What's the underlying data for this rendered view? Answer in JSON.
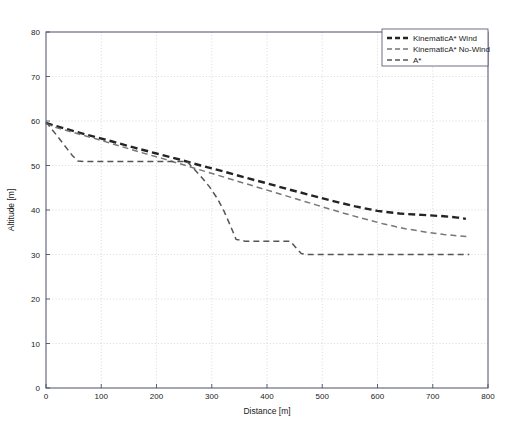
{
  "chart_data": {
    "type": "line",
    "title": "",
    "xlabel": "Distance [m]",
    "ylabel": "Altitude [m]",
    "xlim": [
      0,
      800
    ],
    "ylim": [
      0,
      80
    ],
    "xticks": [
      0,
      100,
      200,
      300,
      400,
      500,
      600,
      700,
      800
    ],
    "yticks": [
      0,
      10,
      20,
      30,
      40,
      50,
      60,
      70,
      80
    ],
    "xtick_labels": [
      "0",
      "100",
      "200",
      "300",
      "400",
      "500",
      "600",
      "700",
      "800"
    ],
    "ytick_labels": [
      "0",
      "10",
      "20",
      "30",
      "40",
      "50",
      "60",
      "70",
      "80"
    ],
    "grid": true,
    "grid_style": "dotted",
    "legend_position": "top-right",
    "series": [
      {
        "name": "KinematicA* Wind",
        "color": "#242424",
        "width": 2.4,
        "dash": "7 4",
        "points": [
          [
            0,
            59.6
          ],
          [
            14,
            59.0
          ],
          [
            40,
            58.1
          ],
          [
            80,
            56.7
          ],
          [
            120,
            55.4
          ],
          [
            160,
            54.0
          ],
          [
            200,
            52.7
          ],
          [
            240,
            51.4
          ],
          [
            280,
            50.0
          ],
          [
            320,
            48.7
          ],
          [
            360,
            47.3
          ],
          [
            400,
            46.0
          ],
          [
            440,
            44.6
          ],
          [
            480,
            43.3
          ],
          [
            520,
            42.0
          ],
          [
            560,
            40.8
          ],
          [
            600,
            39.8
          ],
          [
            640,
            39.2
          ],
          [
            680,
            38.9
          ],
          [
            720,
            38.6
          ],
          [
            745,
            38.3
          ],
          [
            760,
            38.0
          ]
        ]
      },
      {
        "name": "KinematicA* No-Wind",
        "color": "#777777",
        "width": 1.5,
        "dash": "6 4",
        "points": [
          [
            0,
            59.4
          ],
          [
            16,
            58.6
          ],
          [
            50,
            57.4
          ],
          [
            90,
            56.0
          ],
          [
            130,
            54.5
          ],
          [
            170,
            53.0
          ],
          [
            210,
            51.6
          ],
          [
            250,
            50.1
          ],
          [
            290,
            48.6
          ],
          [
            330,
            47.1
          ],
          [
            370,
            45.6
          ],
          [
            410,
            44.1
          ],
          [
            450,
            42.6
          ],
          [
            490,
            41.1
          ],
          [
            530,
            39.6
          ],
          [
            570,
            38.2
          ],
          [
            610,
            36.9
          ],
          [
            650,
            35.8
          ],
          [
            690,
            35.0
          ],
          [
            720,
            34.5
          ],
          [
            745,
            34.2
          ],
          [
            765,
            34.0
          ]
        ]
      },
      {
        "name": "A*",
        "color": "#555555",
        "width": 1.5,
        "dash": "6 4",
        "points": [
          [
            0,
            59.8
          ],
          [
            8,
            58.5
          ],
          [
            18,
            57.0
          ],
          [
            28,
            55.4
          ],
          [
            38,
            53.8
          ],
          [
            48,
            52.2
          ],
          [
            58,
            51.0
          ],
          [
            70,
            50.9
          ],
          [
            120,
            50.9
          ],
          [
            180,
            50.9
          ],
          [
            230,
            50.9
          ],
          [
            255,
            50.9
          ],
          [
            268,
            49.2
          ],
          [
            282,
            47.3
          ],
          [
            296,
            45.2
          ],
          [
            310,
            42.6
          ],
          [
            322,
            39.8
          ],
          [
            334,
            36.4
          ],
          [
            344,
            33.4
          ],
          [
            360,
            33.0
          ],
          [
            390,
            33.0
          ],
          [
            420,
            33.0
          ],
          [
            442,
            33.0
          ],
          [
            452,
            31.6
          ],
          [
            462,
            30.2
          ],
          [
            475,
            30.0
          ],
          [
            520,
            30.0
          ],
          [
            580,
            30.0
          ],
          [
            640,
            30.0
          ],
          [
            700,
            30.0
          ],
          [
            745,
            30.0
          ],
          [
            762,
            30.0
          ],
          [
            766,
            30.0
          ]
        ]
      }
    ],
    "legend_entries": [
      {
        "label": "KinematicA* Wind",
        "color": "#242424",
        "width": 2.4,
        "dash": "5 3"
      },
      {
        "label": "KinematicA* No-Wind",
        "color": "#777777",
        "width": 1.4,
        "dash": "5 3"
      },
      {
        "label": "A*",
        "color": "#555555",
        "width": 1.4,
        "dash": "5 3"
      }
    ]
  },
  "layout": {
    "plot_left": 46,
    "plot_right": 488,
    "plot_top": 32,
    "plot_bottom": 388
  }
}
